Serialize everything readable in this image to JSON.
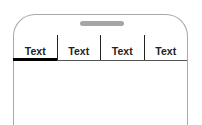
{
  "tabs": [
    {
      "label": "Text",
      "active": true
    },
    {
      "label": "Text",
      "active": false
    },
    {
      "label": "Text",
      "active": false
    },
    {
      "label": "Text",
      "active": false
    }
  ],
  "colors": {
    "frame": "#a9a9a9",
    "speaker": "#a6a6a6",
    "active_indicator": "#000000",
    "divider": "#222222"
  }
}
